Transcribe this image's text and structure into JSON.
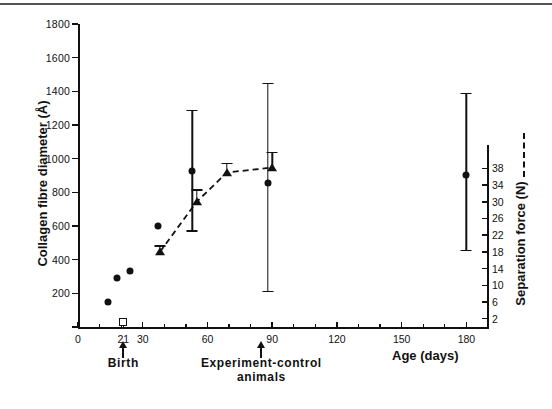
{
  "chart_data": {
    "type": "scatter",
    "title": "",
    "xlabel": "Age (days)",
    "ylabel": "Collagen fibre diameter (Å)",
    "y2label": "Separation force (N)",
    "xlim": [
      0,
      190
    ],
    "ylim": [
      0,
      1800
    ],
    "y2lim": [
      0,
      40
    ],
    "grid": false,
    "legend_position": "right-axis",
    "xticks": [
      0,
      21,
      30,
      60,
      90,
      120,
      150,
      180
    ],
    "xtick_labels": [
      "0",
      "21",
      "30",
      "60",
      "90",
      "120",
      "150",
      "180"
    ],
    "xticks_minor": [
      10,
      20,
      30,
      40,
      50,
      60,
      70,
      80,
      90,
      100,
      110,
      120,
      130,
      140,
      150,
      160,
      170,
      180
    ],
    "yticks": [
      0,
      200,
      400,
      600,
      800,
      1000,
      1200,
      1400,
      1600,
      1800
    ],
    "ytick_labels": [
      "",
      "200",
      "400",
      "600",
      "800",
      "1000",
      "1200",
      "1400",
      "1600",
      "1800"
    ],
    "y2ticks": [
      2,
      6,
      10,
      14,
      18,
      22,
      26,
      30,
      34,
      38
    ],
    "y2tick_labels": [
      "2",
      "6",
      "10",
      "14",
      "18",
      "22",
      "26",
      "30",
      "34",
      "38"
    ],
    "series": [
      {
        "name": "Collagen fibre diameter",
        "marker": "filled-circle",
        "axis": "left",
        "connected": false,
        "points": [
          {
            "x": 14,
            "y": 150
          },
          {
            "x": 18,
            "y": 290
          },
          {
            "x": 21,
            "y": 30,
            "marker": "open-square"
          },
          {
            "x": 24,
            "y": 335
          },
          {
            "x": 37,
            "y": 600
          },
          {
            "x": 53,
            "y": 925,
            "err_low": 575,
            "err_high": 1290
          },
          {
            "x": 88,
            "y": 855,
            "err_low": 215,
            "err_high": 1450
          },
          {
            "x": 180,
            "y": 905,
            "err_low": 460,
            "err_high": 1390
          }
        ]
      },
      {
        "name": "Separation force",
        "marker": "filled-triangle",
        "axis": "right",
        "connected": true,
        "linestyle": "dashed",
        "points": [
          {
            "x": 38,
            "y": 18.0,
            "err_high": 19.6
          },
          {
            "x": 55,
            "y": 30.0,
            "err_high": 33.0
          },
          {
            "x": 69,
            "y": 37.0,
            "err_high": 39.4
          },
          {
            "x": 90,
            "y": 38.2,
            "err_high": 42.0
          }
        ]
      }
    ],
    "annotations": [
      {
        "text": "Birth",
        "x": 21,
        "arrow": true
      },
      {
        "text": "Experiment-control\nanimals",
        "x": 85,
        "arrow": true
      }
    ]
  },
  "axes": {
    "y_title": "Collagen fibre diameter (Å)",
    "y2_title": "Separation force (N)",
    "x_title": "Age (days)"
  },
  "annotations": {
    "birth": "Birth",
    "experiment_line1": "Experiment-control",
    "experiment_line2": "animals"
  },
  "colors": {
    "ink": "#111111",
    "background": "#ffffff",
    "rule": "#555555"
  }
}
